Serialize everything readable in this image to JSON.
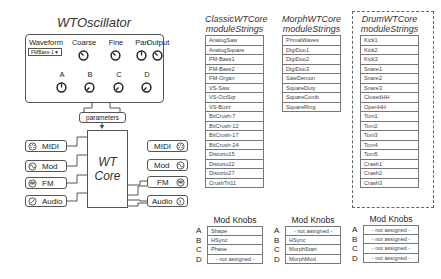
{
  "oscillator": {
    "title": "WTOscillator",
    "waveform": {
      "label": "Waveform",
      "selected": "FMBass-1"
    },
    "knobs_top": [
      {
        "label": "Coarse"
      },
      {
        "label": "Fine"
      },
      {
        "label": "Pan"
      },
      {
        "label": "Output"
      }
    ],
    "knobs_mod": [
      {
        "label": "A"
      },
      {
        "label": "B"
      },
      {
        "label": "C"
      },
      {
        "label": "D"
      }
    ],
    "parameters_label": "parameters"
  },
  "core": {
    "line1": "WT",
    "line2": "Core",
    "inputs": [
      {
        "label": "MIDI",
        "icon": "midi-icon"
      },
      {
        "label": "Mod",
        "icon": "mod-wave-icon"
      },
      {
        "label": "FM",
        "icon": "fm-icon"
      },
      {
        "label": "Audio",
        "icon": "audio-icon"
      }
    ],
    "outputs": [
      {
        "label": "MIDI",
        "icon": "midi-icon"
      },
      {
        "label": "Mod",
        "icon": "mod-wave-icon"
      },
      {
        "label": "FM",
        "icon": "fm-icon"
      },
      {
        "label": "Audio",
        "icon": "audio-icon"
      }
    ]
  },
  "tables": {
    "classic": {
      "title1": "ClassicWTCore",
      "title2": "moduleStrings",
      "items": [
        "AnalogSaw",
        "AnalogSquare",
        "FM-Bass1",
        "FM-Bass2",
        "FM-Organ",
        "VS-Saw",
        "VS-OctSqr",
        "VS-Buzz",
        "BitCrush-7",
        "BitCrush-12",
        "BitCrush-17",
        "BitCrush-24",
        "Distorto15",
        "Distorto22",
        "Distorto27",
        "CrushTri11"
      ]
    },
    "morph": {
      "title1": "MorphWTCore",
      "title2": "moduleStrings",
      "items": [
        "PrimalWaves",
        "DigiDoo1",
        "DigiDoo2",
        "DigiDoo3",
        "SawDemon",
        "SquareDuty",
        "SquareComb",
        "SquareRing"
      ]
    },
    "drum": {
      "title1": "DrumWTCore",
      "title2": "moduleStrings",
      "items": [
        "Kick1",
        "Kick2",
        "Kick3",
        "Snare1",
        "Snare2",
        "Snare3",
        "ClosedHH",
        "OpenHH",
        "Tom1",
        "Tom2",
        "Tom3",
        "Tom4",
        "Tom5",
        "Crash1",
        "Crash2",
        "Crash3"
      ]
    }
  },
  "mod_knobs": [
    {
      "title": "Mod Knobs",
      "rows": [
        {
          "letter": "A",
          "value": "Shape"
        },
        {
          "letter": "B",
          "value": "HSync"
        },
        {
          "letter": "C",
          "value": "Phase"
        },
        {
          "letter": "D",
          "value": "- not assigned -"
        }
      ]
    },
    {
      "title": "Mod Knobs",
      "rows": [
        {
          "letter": "A",
          "value": "- not assigned -"
        },
        {
          "letter": "B",
          "value": "HSync"
        },
        {
          "letter": "C",
          "value": "MorphStart"
        },
        {
          "letter": "D",
          "value": "MorphMod"
        }
      ]
    },
    {
      "title": "Mod Knobs",
      "rows": [
        {
          "letter": "A",
          "value": "- not assigned -"
        },
        {
          "letter": "B",
          "value": "- not assigned -"
        },
        {
          "letter": "C",
          "value": "- not assigned -"
        },
        {
          "letter": "D",
          "value": "- not assigned -"
        }
      ]
    }
  ]
}
